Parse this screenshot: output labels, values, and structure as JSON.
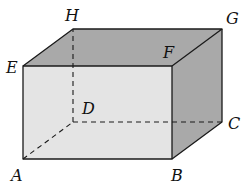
{
  "diagram": {
    "type": "rectangular-prism",
    "colors": {
      "front_face": "#e4e4e4",
      "top_face": "#a9a9a9",
      "right_face": "#a9a9a9",
      "edge": "#1a1a1a",
      "hidden_edge": "#1a1a1a"
    },
    "vertices": {
      "A": {
        "label": "A",
        "x": 23,
        "y": 159
      },
      "B": {
        "label": "B",
        "x": 172,
        "y": 159
      },
      "C": {
        "label": "C",
        "x": 222,
        "y": 122
      },
      "D": {
        "label": "D",
        "x": 73,
        "y": 122
      },
      "E": {
        "label": "E",
        "x": 23,
        "y": 66
      },
      "F": {
        "label": "F",
        "x": 172,
        "y": 66
      },
      "G": {
        "label": "G",
        "x": 222,
        "y": 29
      },
      "H": {
        "label": "H",
        "x": 73,
        "y": 29
      }
    },
    "visible_edges": [
      "AB",
      "BF",
      "FE",
      "EA",
      "EH",
      "HG",
      "GF",
      "GC",
      "CB"
    ],
    "hidden_edges": [
      "AD",
      "DC",
      "DH"
    ]
  }
}
